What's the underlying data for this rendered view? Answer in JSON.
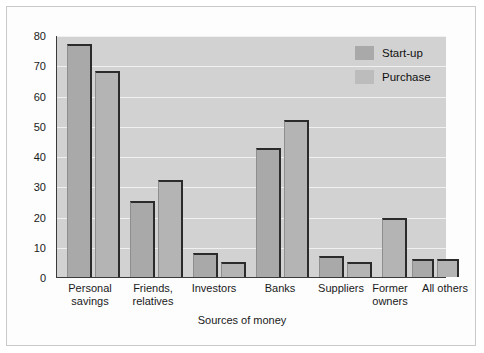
{
  "chart_data": {
    "type": "bar",
    "title": "",
    "xlabel": "Sources of money",
    "ylabel": "Percent of businesses",
    "ylim": [
      0,
      80
    ],
    "yticks": [
      0,
      10,
      20,
      30,
      40,
      50,
      60,
      70,
      80
    ],
    "grid": true,
    "legend_position": "top-right",
    "categories": [
      "Personal\nsavings",
      "Friends,\nrelatives",
      "Investors",
      "Banks",
      "Suppliers",
      "Former\nowners",
      "All others"
    ],
    "series": [
      {
        "name": "Start-up",
        "color": "#a9a9a9",
        "values": [
          77,
          25,
          8,
          42.5,
          7,
          null,
          6
        ]
      },
      {
        "name": "Purchase",
        "color": "#b4b4b4",
        "values": [
          68,
          32,
          5,
          52,
          5,
          19.5,
          6
        ]
      }
    ]
  },
  "legend": {
    "items": [
      {
        "label": "Start-up"
      },
      {
        "label": "Purchase"
      }
    ]
  },
  "axes": {
    "y_tick_labels": [
      "80",
      "70",
      "60",
      "50",
      "40",
      "30",
      "20",
      "10",
      "0"
    ],
    "y_axis_title": "Percent of businesses",
    "x_axis_title": "Sources of money",
    "x_tick_labels": [
      "Personal\nsavings",
      "Friends,\nrelatives",
      "Investors",
      "Banks",
      "Suppliers",
      "Former\nowners",
      "All others"
    ]
  },
  "colors": {
    "plot_background": "#d2d2d2",
    "gridline": "#f0f0f0",
    "axis": "#3b3b3b",
    "bar_edge": "#2b2b2b",
    "startup_fill": "#a9a9a9",
    "purchase_fill": "#b4b4b4",
    "page_background": "#ffffff"
  }
}
